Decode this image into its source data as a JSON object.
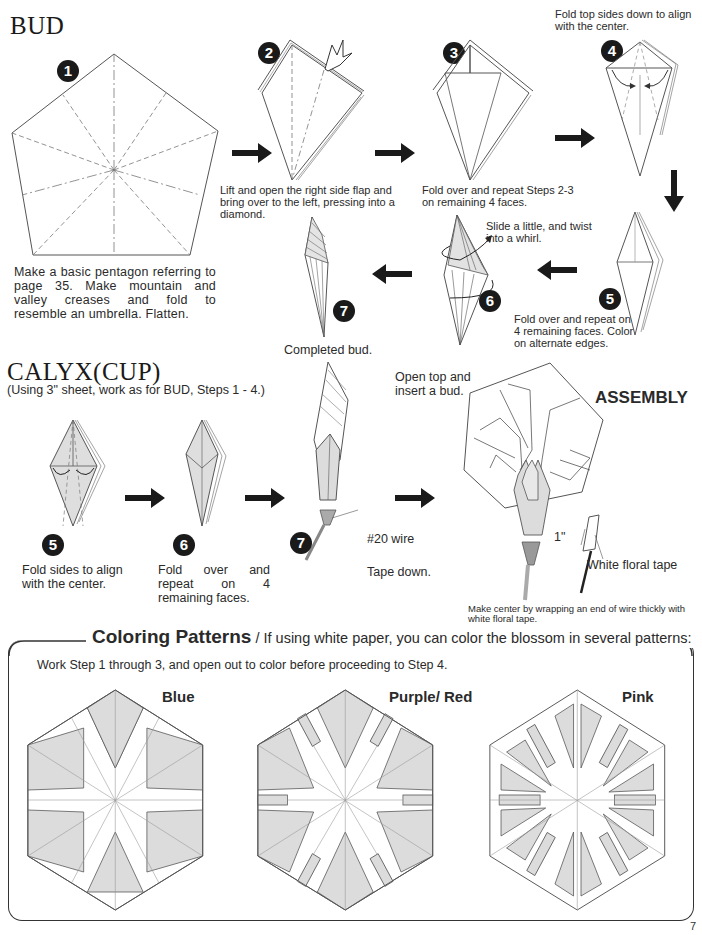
{
  "page_number": "7",
  "bud": {
    "title": "BUD",
    "steps": [
      {
        "num": "1",
        "caption": "Make a basic pentagon referring to page 35. Make mountain and valley creases and fold to resemble an umbrella. Flatten."
      },
      {
        "num": "2",
        "caption": "Lift and open the right side flap and bring over to the left, pressing into a diamond."
      },
      {
        "num": "3",
        "caption": "Fold over and repeat Steps 2-3 on remaining 4 faces."
      },
      {
        "num": "4",
        "caption": "Fold top sides down to align with the center."
      },
      {
        "num": "5",
        "caption": "Fold over and repeat on 4 remaining faces. Color on alternate edges."
      },
      {
        "num": "6",
        "caption": "Slide a little, and twist into a whirl."
      },
      {
        "num": "7",
        "caption": "Completed bud."
      }
    ]
  },
  "calyx": {
    "title": "CALYX(CUP)",
    "subtitle": "(Using 3\" sheet, work as for BUD, Steps 1 - 4.)",
    "steps": [
      {
        "num": "5",
        "caption": "Fold sides to align with the center."
      },
      {
        "num": "6",
        "caption": "Fold over and repeat on 4 remaining faces."
      },
      {
        "num": "7",
        "caption": "Open top and insert a bud.",
        "label_wire": "#20 wire",
        "label_tape": "Tape down."
      }
    ]
  },
  "assembly": {
    "title": "ASSEMBLY",
    "tape_length": "1\"",
    "tape_label": "White floral tape",
    "caption": "Make center by wrapping an end of wire thickly with white floral tape."
  },
  "coloring": {
    "title": "Coloring Patterns",
    "subtitle": " / If using white paper, you can color the blossom in several patterns:",
    "instruction": "Work Step 1 through 3, and open out to color before proceeding to Step 4.",
    "patterns": [
      {
        "label": "Blue"
      },
      {
        "label": "Purple/ Red"
      },
      {
        "label": "Pink"
      }
    ],
    "fill_color": "#dcdcdc",
    "line_color": "#555555"
  }
}
